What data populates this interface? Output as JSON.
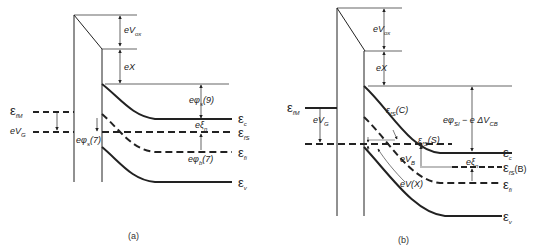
{
  "panels": [
    {
      "id": "a",
      "caption": "(a)",
      "labels": {
        "eVox": "eV",
        "eVox_sub": "ox",
        "eChi": "eX",
        "ephis9": "eφ",
        "ephis9_sub": "s",
        "ephis9_suffix": "(9)",
        "efm": "ε",
        "efm_sub": "fM",
        "evg": "eV",
        "evg_sub": "G",
        "ephis7": "eφ",
        "ephis7_sub": "s",
        "ephis7_suffix": "(7)",
        "exin": "eξ",
        "exin_sub": "n",
        "ephib7": "eφ",
        "ephib7_sub": "b",
        "ephib7_suffix": "(7)",
        "ec": "ε",
        "ec_sub": "c",
        "efs": "ε",
        "efs_sub": "fS",
        "efi": "ε",
        "efi_sub": "fi",
        "ev": "ε",
        "ev_sub": "v"
      }
    },
    {
      "id": "b",
      "caption": "(b)",
      "labels": {
        "eVox": "eV",
        "eVox_sub": "ox",
        "eChi": "eX",
        "efm": "ε",
        "efm_sub": "fM",
        "evg": "eV",
        "evg_sub": "G",
        "efsC": "ε",
        "efsC_sub": "fS",
        "efsC_suffix": "(C)",
        "ephisi": "eφ",
        "ephisi_sub": "SI",
        "ephisi_suffix": " − e ΔV",
        "ephisi_suffix_sub": "CB",
        "efsS": "ε",
        "efsS_sub": "fS",
        "efsS_suffix": "(S)",
        "evb": "eV",
        "evb_sub": "B",
        "evx": "eV(X)",
        "exin": "eξ",
        "exin_sub": "n",
        "ec": "ε",
        "ec_sub": "c",
        "efsB": "ε",
        "efsB_sub": "fS",
        "efsB_suffix": "(B)",
        "efi": "ε",
        "efi_sub": "fi",
        "ev": "ε",
        "ev_sub": "v"
      }
    }
  ]
}
